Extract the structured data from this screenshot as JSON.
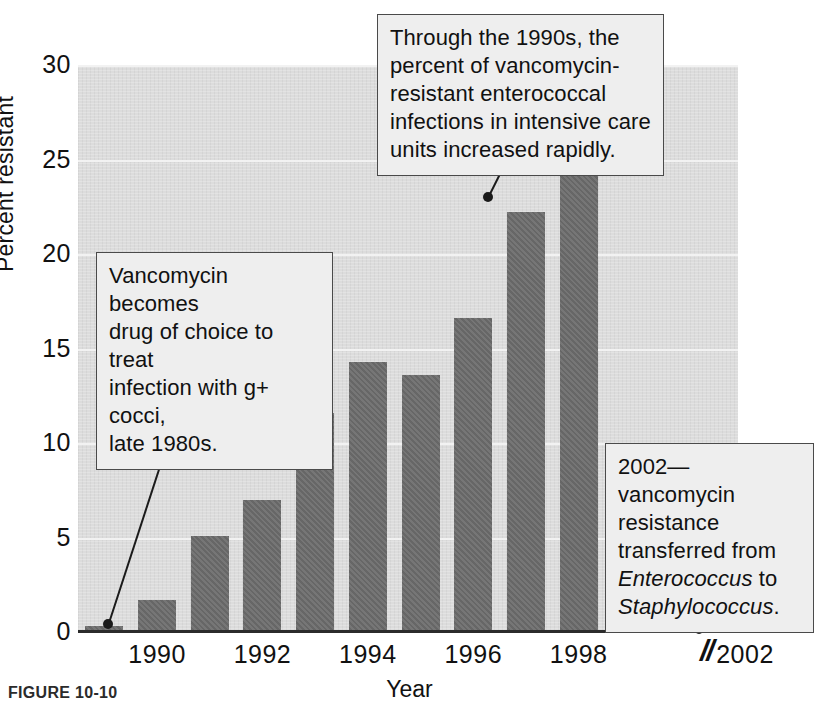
{
  "figure": {
    "caption": "FIGURE 10-10",
    "axis_break_symbol": "//"
  },
  "chart_data": {
    "type": "bar",
    "title": "",
    "xlabel": "Year",
    "ylabel": "Percent resistant",
    "categories": [
      "1989",
      "1990",
      "1991",
      "1992",
      "1993",
      "1994",
      "1995",
      "1996",
      "1997",
      "1998"
    ],
    "values": [
      0.3,
      1.7,
      5.1,
      7.0,
      11.6,
      14.3,
      13.6,
      16.6,
      22.2,
      24.2
    ],
    "ylim": [
      0,
      30
    ],
    "yticks": [
      "0",
      "5",
      "10",
      "15",
      "20",
      "25",
      "30"
    ],
    "ytick_values": [
      0,
      5,
      10,
      15,
      20,
      25,
      30
    ],
    "xticks": [
      "1990",
      "1992",
      "1994",
      "1996",
      "1998",
      "2002"
    ],
    "xtick_categories": [
      "1990",
      "1992",
      "1994",
      "1996",
      "1998"
    ],
    "grid": true,
    "legend": "none",
    "bar_color": "#6c6c6c",
    "plot_background": "#dcdcdc",
    "gridline_color": "#f2f2f2",
    "axis_break_after": "1998",
    "annotations": [
      {
        "id": "icu",
        "text": "Through the 1990s, the percent of vancomycin-resistant enterococcal infections in intensive care units increased rapidly.",
        "lines": [
          "Through the 1990s, the",
          "percent of vancomycin-",
          "resistant enterococcal",
          "infections in intensive care",
          "units increased rapidly."
        ],
        "points_to": "1996"
      },
      {
        "id": "vancomycin",
        "text": "Vancomycin becomes drug of choice to treat infection with g+ cocci, late 1980s.",
        "lines": [
          "Vancomycin becomes",
          "drug of choice to treat",
          "infection with g+ cocci,",
          "late 1980s."
        ],
        "points_to": "1989"
      },
      {
        "id": "transfer-2002",
        "text": "2002—vancomycin resistance transferred from Enterococcus to Staphylococcus.",
        "lines": [
          "2002—vancomycin",
          "resistance",
          "transferred from",
          "Enterococcus to",
          "Staphylococcus."
        ],
        "italic_terms": [
          "Enterococcus",
          "Staphylococcus"
        ],
        "points_to": "2002"
      }
    ]
  }
}
